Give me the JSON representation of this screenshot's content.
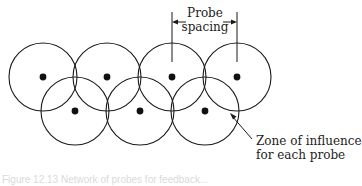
{
  "diagram": {
    "labels": {
      "probe_spacing_line1": "Probe",
      "probe_spacing_line2": "spacing",
      "zone_line1": "Zone of influence",
      "zone_line2": "for each probe"
    },
    "caption": "Figure 12.13  Network of probes for feedback...",
    "probes": {
      "radius": 34,
      "top_row": [
        {
          "x": 43,
          "y": 77
        },
        {
          "x": 107,
          "y": 77
        },
        {
          "x": 172,
          "y": 77
        },
        {
          "x": 237,
          "y": 77
        }
      ],
      "bottom_row": [
        {
          "x": 75,
          "y": 111
        },
        {
          "x": 140,
          "y": 111
        },
        {
          "x": 205,
          "y": 111
        }
      ]
    },
    "colors": {
      "stroke": "#1a1a1a",
      "dot": "#111111",
      "background": "#ffffff"
    }
  }
}
